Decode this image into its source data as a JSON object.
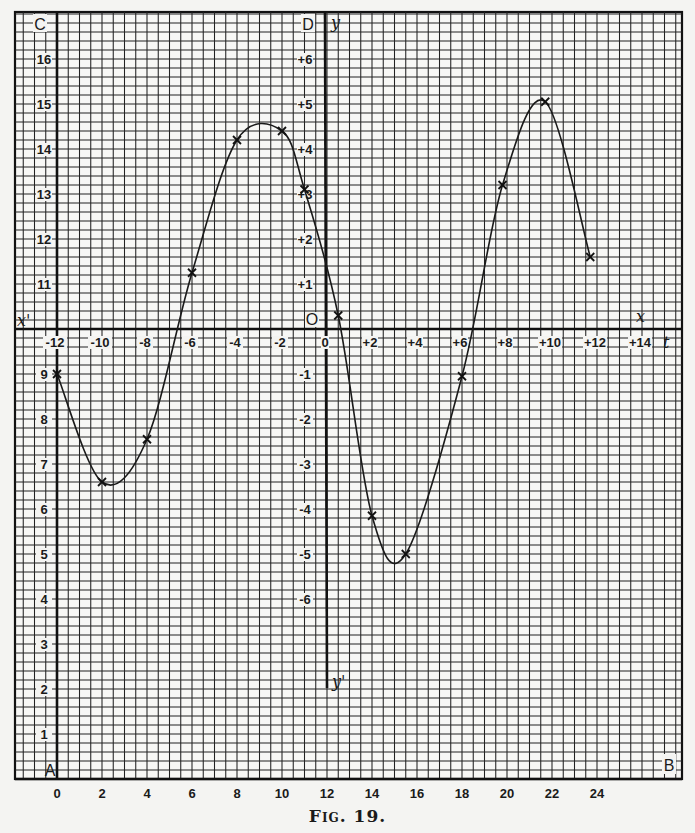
{
  "figure": {
    "caption": "Fig. 19."
  },
  "chart_data": {
    "type": "line",
    "title": "",
    "caption": "Fig. 19.",
    "grid": true,
    "markers": "x",
    "corner_labels": {
      "top_left": "C",
      "top_right_axis": "D",
      "bottom_left": "A",
      "bottom_right": "B"
    },
    "axis_labels": {
      "x_pos": "x",
      "x_neg": "x'",
      "y_pos": "y",
      "y_neg": "y'",
      "t": "t",
      "origin": "O"
    },
    "primary_axes": {
      "xlabel": "",
      "ylabel": "",
      "x_ticks": [
        "0",
        "2",
        "4",
        "6",
        "8",
        "10",
        "12",
        "14",
        "16",
        "18",
        "20",
        "22",
        "24"
      ],
      "y_ticks": [
        "1",
        "2",
        "3",
        "4",
        "5",
        "6",
        "7",
        "8",
        "9",
        "11",
        "12",
        "13",
        "14",
        "15",
        "16"
      ],
      "xlim": [
        0,
        28
      ],
      "ylim": [
        0,
        17
      ]
    },
    "secondary_axes": {
      "origin_at_primary": [
        12,
        10
      ],
      "x_ticks": [
        "-12",
        "-10",
        "-8",
        "-6",
        "-4",
        "-2",
        "0",
        "+2",
        "+4",
        "+6",
        "+8",
        "+10",
        "+12",
        "+14"
      ],
      "y_ticks": [
        "+6",
        "+5",
        "+4",
        "+3",
        "+2",
        "+1",
        "0",
        "-1",
        "-2",
        "-3",
        "-4",
        "-5",
        "-6"
      ]
    },
    "series": [
      {
        "name": "curve",
        "x": [
          0,
          2,
          4,
          6,
          8,
          10,
          11,
          12.5,
          14,
          15.5,
          18,
          19.8,
          21.7,
          23.7
        ],
        "values": [
          9.0,
          6.6,
          7.55,
          11.25,
          14.2,
          14.4,
          13.1,
          10.3,
          5.85,
          5.0,
          8.95,
          13.2,
          15.05,
          11.6
        ]
      }
    ]
  }
}
